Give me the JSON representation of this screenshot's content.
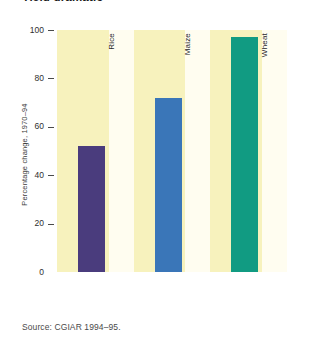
{
  "title": "Yield dramatic",
  "source": "Source: CGIAR 1994–95.",
  "chart_data": {
    "type": "bar",
    "title": "Yield dramatic",
    "xlabel": "",
    "ylabel": "Percentage change, 1970–94",
    "ylim": [
      0,
      100
    ],
    "yticks": [
      0,
      20,
      40,
      60,
      80,
      100
    ],
    "ytick_labels": [
      "0",
      "20",
      "40",
      "60",
      "80",
      "100"
    ],
    "grid": false,
    "legend": "none",
    "categories": [
      "Rice",
      "Maize",
      "Wheat"
    ],
    "values": [
      52,
      72,
      97
    ],
    "colors": [
      "#4a3c7d",
      "#3a76b8",
      "#119b82"
    ],
    "band_color": "#f7f2bd",
    "plot_background": "#fffdf0",
    "source": "Source: CGIAR 1994–95."
  }
}
